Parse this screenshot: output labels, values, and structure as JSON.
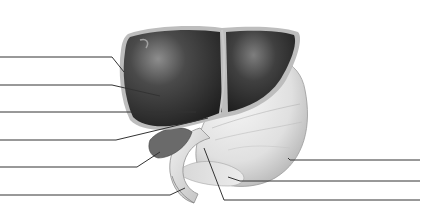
{
  "diagram": {
    "colors": {
      "liver_dark": "#2b2b2b",
      "liver_mid": "#4a4a4a",
      "liver_highlight": "#8a8a8a",
      "capsule": "#bdbdbd",
      "stomach": "#e4e4e4",
      "stomach_shade": "#c9c9c9",
      "leader_line": "#333333",
      "background": "#ffffff"
    },
    "left_labels": [
      {
        "id": "L1",
        "text": "",
        "y": 57,
        "x_end": 112,
        "target": [
          124,
          72
        ]
      },
      {
        "id": "L2",
        "text": "",
        "y": 85,
        "x_end": 112,
        "target": [
          160,
          96
        ]
      },
      {
        "id": "L3",
        "text": "",
        "y": 112,
        "x_end": 190,
        "target": [
          196,
          112
        ]
      },
      {
        "id": "L4",
        "text": "",
        "y": 140,
        "x_end": 116,
        "target": [
          208,
          118
        ]
      },
      {
        "id": "L5",
        "text": "",
        "y": 167,
        "x_end": 137,
        "target": [
          160,
          152
        ]
      },
      {
        "id": "L6",
        "text": "",
        "y": 195,
        "x_end": 170,
        "target": [
          185,
          188
        ]
      }
    ],
    "right_labels": [
      {
        "id": "R1",
        "text": "",
        "y": 160,
        "x_start": 290,
        "target": [
          288,
          158
        ]
      },
      {
        "id": "R2",
        "text": "",
        "y": 181,
        "x_start": 240,
        "target": [
          228,
          177
        ]
      },
      {
        "id": "R3",
        "text": "",
        "y": 200,
        "x_start": 224,
        "target": [
          204,
          148
        ]
      }
    ]
  }
}
